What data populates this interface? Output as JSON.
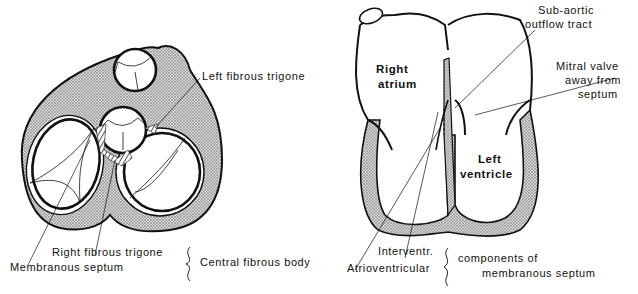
{
  "left_figure": {
    "labels": {
      "left_fibrous_trigone": "Left fibrous trigone",
      "right_fibrous_trigone": "Right fibrous trigone",
      "membranous_septum": "Membranous septum",
      "central_fibrous_body": "Central fibrous body"
    }
  },
  "right_figure": {
    "labels": {
      "right_atrium_line1": "Right",
      "right_atrium_line2": "atrium",
      "left_ventricle_line1": "Left",
      "left_ventricle_line2": "ventricle",
      "sub_aortic_line1": "Sub-aortic",
      "sub_aortic_line2": "outflow tract",
      "mitral_line1": "Mitral valve",
      "mitral_line2": "away from",
      "mitral_line3": "septum",
      "interventr": "Interventr.",
      "atrioventricular": "Atrioventricular",
      "components_line1": "components of",
      "components_line2": "membranous septum"
    }
  },
  "colors": {
    "ink": "#111111",
    "stipple": "#9a9a9a",
    "background": "#ffffff"
  }
}
